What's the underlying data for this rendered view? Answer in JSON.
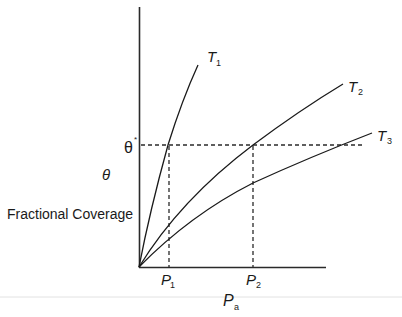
{
  "diagram": {
    "y_axis": {
      "symbol": "θ",
      "label": "Fractional Coverage",
      "marked_value": "θ",
      "marked_value_superscript": "*"
    },
    "x_axis": {
      "symbol": "P",
      "symbol_subscript": "a",
      "ticks": [
        {
          "symbol": "P",
          "subscript": "1"
        },
        {
          "symbol": "P",
          "subscript": "2"
        }
      ]
    },
    "curves": [
      {
        "name": "T",
        "subscript": "1"
      },
      {
        "name": "T",
        "subscript": "2"
      },
      {
        "name": "T",
        "subscript": "3"
      }
    ]
  },
  "colors": {
    "line": "#1a1a1a",
    "background": "#ffffff",
    "rule": "#dddddd"
  }
}
